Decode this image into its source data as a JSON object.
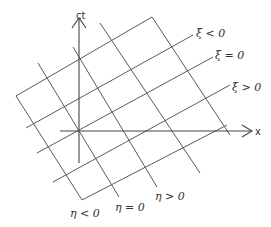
{
  "axes": {
    "time_label": "ct",
    "space_label": "x"
  },
  "xi_lines": [
    {
      "label": ""
    },
    {
      "label": "ξ < 0"
    },
    {
      "label": "ξ = 0"
    },
    {
      "label": "ξ > 0"
    },
    {
      "label": ""
    }
  ],
  "eta_lines": [
    {
      "label": "η < 0"
    },
    {
      "label": "η = 0"
    },
    {
      "label": "η > 0"
    },
    {
      "label": ""
    },
    {
      "label": ""
    }
  ],
  "labels": {
    "xi_neg": "ξ < 0",
    "xi_zero": "ξ = 0",
    "xi_pos": "ξ > 0",
    "eta_neg": "η < 0",
    "eta_zero": "η = 0",
    "eta_pos": "η > 0"
  },
  "colors": {
    "line": "#5a5a5a",
    "text": "#333333",
    "background": "#ffffff"
  }
}
